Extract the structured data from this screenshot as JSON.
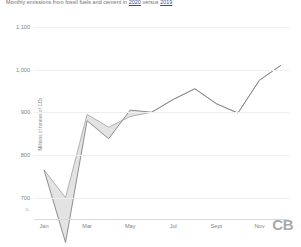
{
  "title": {
    "before": "Monthly emissions from fossil fuels and cement in ",
    "link1": "2020",
    "middle": " versus ",
    "link2": "2019"
  },
  "logo": "CB",
  "axis": {
    "ylabel_text": "Millions of tonnes of CO",
    "ylabel_sub": "2",
    "break_symbol": "≈"
  },
  "chart_data": {
    "type": "line",
    "title": "Monthly emissions from fossil fuels and cement in 2020 versus 2019",
    "xlabel": "",
    "ylabel": "Millions of tonnes of CO2",
    "ylim": [
      650,
      1130
    ],
    "yticks": [
      700,
      800,
      900,
      1000,
      1100
    ],
    "ytick_labels": [
      "700",
      "800",
      "900",
      "1,000",
      "1,100"
    ],
    "grid": true,
    "axis_break": true,
    "legend_position": "none",
    "x": [
      "Jan",
      "Feb",
      "Mar",
      "Apr",
      "May",
      "Jun",
      "Jul",
      "Aug",
      "Sept",
      "Oct",
      "Nov",
      "Dec"
    ],
    "xtick_labels": [
      "Jan",
      "Mar",
      "May",
      "Jul",
      "Sept",
      "Nov"
    ],
    "xtick_indices": [
      0,
      2,
      4,
      6,
      8,
      10
    ],
    "series": [
      {
        "name": "2020",
        "color": "#808285",
        "values": [
          765,
          595,
          880,
          838,
          905,
          900,
          930,
          955,
          920,
          898,
          975,
          1010
        ]
      },
      {
        "name": "2019",
        "color": "#a7a9ac",
        "values": [
          765,
          700,
          895,
          865,
          890,
          900,
          930,
          955,
          920,
          898,
          975,
          1010
        ]
      }
    ],
    "shaded_band": {
      "between": [
        "2020",
        "2019"
      ],
      "color": "#d9d9d9",
      "opacity": 0.75
    }
  }
}
